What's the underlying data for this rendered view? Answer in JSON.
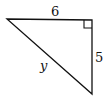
{
  "diagram": {
    "type": "right-triangle",
    "labels": {
      "top_side": "6",
      "right_side": "5",
      "hypotenuse": "y"
    },
    "right_angle_at": "top-right",
    "colors": {
      "stroke": "#111111",
      "background": "#ffffff"
    }
  }
}
